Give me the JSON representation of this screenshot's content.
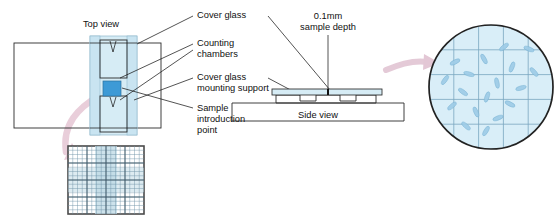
{
  "figure": {
    "views": {
      "top_view_label": "Top view",
      "side_view_label": "Side view"
    },
    "callouts": [
      {
        "id": "cover-glass",
        "text": "Cover glass"
      },
      {
        "id": "counting-chambers",
        "line1": "Counting",
        "line2": "chambers"
      },
      {
        "id": "cover-glass-mount",
        "line1": "Cover glass",
        "line2": "mounting support"
      },
      {
        "id": "sample-intro-point",
        "line1": "Sample",
        "line2": "introduction",
        "line3": "point"
      }
    ],
    "depth_annotation": {
      "line1": "0.1mm",
      "line2": "sample depth"
    },
    "colors": {
      "cover_glass_fill": "#d6ecf5",
      "sample_square_fill": "#3d9ad6",
      "circle_field_fill": "#d9eef8",
      "grid_line": "#7aa7c0",
      "cell_fill": "#9ecbe6",
      "arrow_pink": "#e6c4d4",
      "outline": "#2a2a2a",
      "text": "#111111"
    },
    "micrograph": {
      "grid_divisions": 5,
      "cell_count": 18,
      "cells": [
        {
          "x": 504,
          "y": 47,
          "rot": -38
        },
        {
          "x": 529,
          "y": 49,
          "rot": 20
        },
        {
          "x": 484,
          "y": 59,
          "rot": 62
        },
        {
          "x": 455,
          "y": 62,
          "rot": -25
        },
        {
          "x": 512,
          "y": 67,
          "rot": -70
        },
        {
          "x": 469,
          "y": 74,
          "rot": 15
        },
        {
          "x": 534,
          "y": 72,
          "rot": 48
        },
        {
          "x": 445,
          "y": 80,
          "rot": -55
        },
        {
          "x": 497,
          "y": 83,
          "rot": 80
        },
        {
          "x": 521,
          "y": 88,
          "rot": -15
        },
        {
          "x": 463,
          "y": 92,
          "rot": 35
        },
        {
          "x": 487,
          "y": 97,
          "rot": -72
        },
        {
          "x": 510,
          "y": 104,
          "rot": 25
        },
        {
          "x": 452,
          "y": 106,
          "rot": -40
        },
        {
          "x": 476,
          "y": 112,
          "rot": 68
        },
        {
          "x": 498,
          "y": 118,
          "rot": -20
        },
        {
          "x": 466,
          "y": 126,
          "rot": 42
        },
        {
          "x": 486,
          "y": 131,
          "rot": -60
        }
      ]
    },
    "counting_grid": {
      "fine_divisions": 16,
      "center_block_divisions": 5
    }
  }
}
